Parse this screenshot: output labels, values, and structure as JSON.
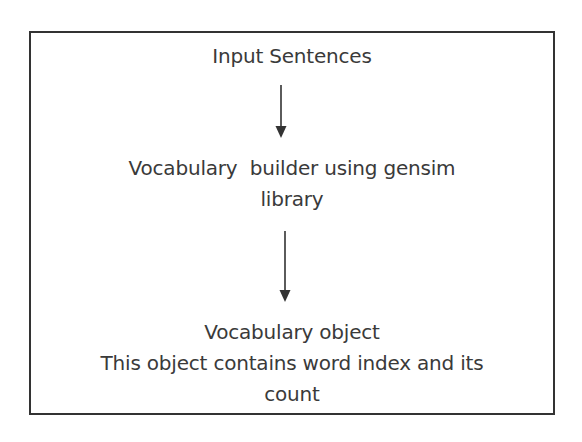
{
  "diagram": {
    "type": "flowchart",
    "direction": "top-to-bottom",
    "nodes": [
      {
        "id": "input",
        "lines": [
          "Input Sentences"
        ]
      },
      {
        "id": "builder",
        "lines": [
          "Vocabulary  builder using gensim",
          "library"
        ]
      },
      {
        "id": "output",
        "lines": [
          "Vocabulary object",
          "This object contains word index and its",
          "count"
        ]
      }
    ],
    "edges": [
      {
        "from": "input",
        "to": "builder"
      },
      {
        "from": "builder",
        "to": "output"
      }
    ],
    "colors": {
      "border": "#333333",
      "text": "#3a3a3a",
      "arrow": "#333333",
      "background": "#ffffff"
    }
  }
}
